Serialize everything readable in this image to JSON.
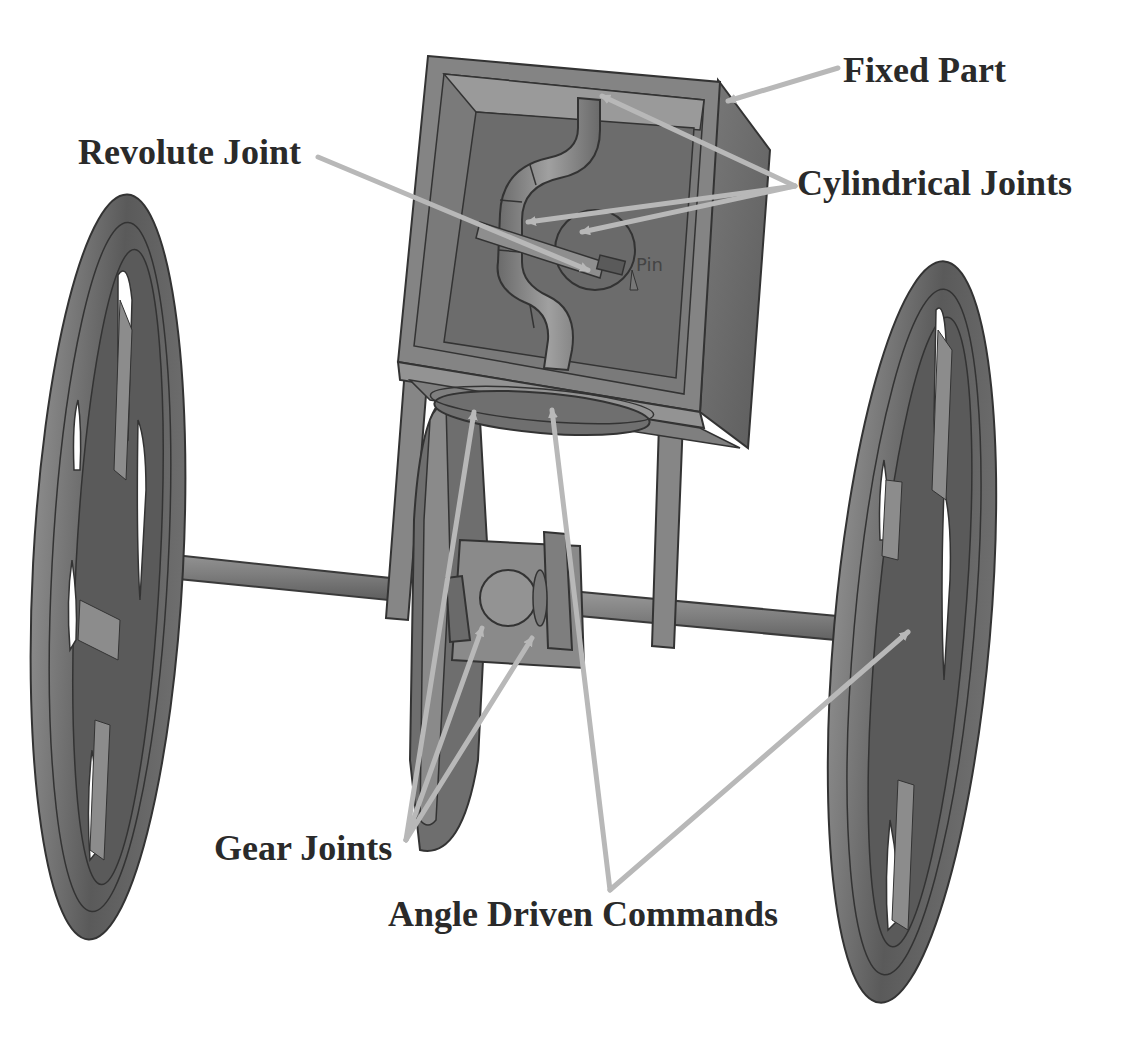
{
  "figure": {
    "colors": {
      "background": "#ffffff",
      "part_fill": "#7a7a7a",
      "part_dark": "#4a4a4a",
      "part_light": "#9a9a9a",
      "outline": "#333333",
      "arrow": "#b8b8b8",
      "label_text": "#2a2a2a"
    }
  },
  "labels": {
    "fixed_part": "Fixed Part",
    "revolute_joint": "Revolute Joint",
    "cylindrical_joints": "Cylindrical Joints",
    "gear_joints": "Gear Joints",
    "angle_driven_commands": "Angle Driven Commands"
  },
  "model_annotations": {
    "pin_text": "Pin"
  }
}
